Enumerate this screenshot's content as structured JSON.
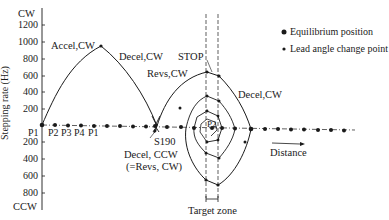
{
  "diagram": {
    "y_axis": {
      "label": "Stepping rate (Hz)",
      "top_label": "CW",
      "bottom_label": "CCW",
      "cw_ticks": [
        "1200",
        "1000",
        "800",
        "600",
        "400",
        "200"
      ],
      "ccw_ticks": [
        "200",
        "400",
        "600",
        "800"
      ]
    },
    "x_axis": {
      "label": "Distance",
      "phase_labels": [
        "P1",
        "P2",
        "P3",
        "P4",
        "P1"
      ]
    },
    "annotations": {
      "accel_cw": "Accel,CW",
      "decel_cw_1": "Decel,CW",
      "stop": "STOP",
      "revs_cw": "Revs,CW",
      "decel_cw_2": "Decel,CW",
      "s190": "S190",
      "decel_ccw": "Decel, CCW",
      "decel_ccw_note": "(=Revs, CW)",
      "p2": "P2",
      "target_zone": "Target zone"
    },
    "legend": [
      {
        "marker": "large-dot",
        "label": "Equilibrium position"
      },
      {
        "marker": "small-dot",
        "label": "Lead angle change point"
      }
    ],
    "caption_fragment": "",
    "colors": {
      "line": "#1a1a1a",
      "background": "#ffffff"
    }
  }
}
